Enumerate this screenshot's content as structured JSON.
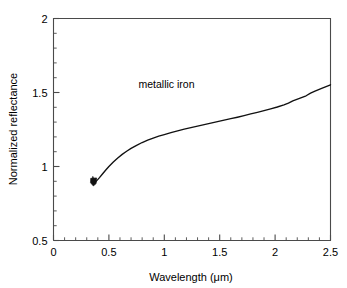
{
  "chart_data": {
    "type": "line",
    "title": "",
    "xlabel": "Wavelength (μm)",
    "ylabel": "Normalized reflectance",
    "xlim": [
      0,
      2.5
    ],
    "ylim": [
      0.5,
      2
    ],
    "grid": false,
    "legend": "none",
    "annotations": [
      {
        "text": "metallic iron",
        "x": 1.02,
        "y": 1.53
      }
    ],
    "xticks": [
      0,
      0.5,
      1,
      1.5,
      2,
      2.5
    ],
    "xtick_labels": [
      "0",
      "0.5",
      "1",
      "1.5",
      "2",
      "2.5"
    ],
    "xticks_minor_step": 0.1,
    "yticks": [
      0.5,
      1,
      1.5,
      2
    ],
    "ytick_labels": [
      "0.5",
      "1",
      "1.5",
      "2"
    ],
    "yticks_minor_step": 0.1,
    "series": [
      {
        "name": "metallic iron",
        "x": [
          0.355,
          0.36,
          0.365,
          0.37,
          0.38,
          0.395,
          0.415,
          0.44,
          0.47,
          0.5,
          0.54,
          0.58,
          0.62,
          0.66,
          0.7,
          0.75,
          0.8,
          0.85,
          0.9,
          0.95,
          1.0,
          1.06,
          1.12,
          1.18,
          1.24,
          1.3,
          1.36,
          1.42,
          1.48,
          1.54,
          1.6,
          1.66,
          1.72,
          1.78,
          1.84,
          1.9,
          1.96,
          2.02,
          2.08,
          2.12,
          2.16,
          2.22,
          2.28,
          2.32,
          2.36,
          2.42,
          2.46,
          2.5
        ],
        "y": [
          0.93,
          0.905,
          0.893,
          0.89,
          0.896,
          0.908,
          0.925,
          0.948,
          0.975,
          1.0,
          1.03,
          1.058,
          1.082,
          1.103,
          1.122,
          1.143,
          1.162,
          1.178,
          1.192,
          1.205,
          1.216,
          1.229,
          1.241,
          1.252,
          1.263,
          1.273,
          1.283,
          1.293,
          1.303,
          1.313,
          1.323,
          1.333,
          1.344,
          1.355,
          1.366,
          1.378,
          1.39,
          1.402,
          1.416,
          1.428,
          1.443,
          1.46,
          1.478,
          1.496,
          1.51,
          1.528,
          1.54,
          1.552
        ]
      }
    ],
    "start_marker": {
      "x": 0.365,
      "y": 0.893
    }
  },
  "figure": {
    "background_color": "#ffffff",
    "line_color": "#111111",
    "axis_color": "#4a4a4a"
  }
}
